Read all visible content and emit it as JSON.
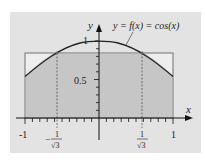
{
  "diagram": {
    "title_label": "y = f(x) = cos(x)",
    "function": "cos(x)",
    "axes": {
      "x_label": "x",
      "y_label": "y",
      "x_range": [
        -1,
        1
      ],
      "y_range": [
        0,
        1
      ]
    },
    "x_ticks": [
      {
        "value": -1,
        "label": "-1"
      },
      {
        "value": -0.57735,
        "label_num": "1",
        "label_den": "√3",
        "sign": "−"
      },
      {
        "value": 0.57735,
        "label_num": "1",
        "label_den": "√3",
        "sign": ""
      },
      {
        "value": 1,
        "label": "1"
      }
    ],
    "y_ticks": [
      {
        "value": 0.5,
        "label": "0.5"
      },
      {
        "value": 1,
        "label": "1"
      }
    ],
    "rectangle_height": 0.8384,
    "gauss_nodes": [
      -0.57735,
      0.57735
    ],
    "colors": {
      "panel_bg": "#e3e3e3",
      "rect_fill": "#c6c6c6",
      "rect_light": "#eeeeee",
      "curve": "#222222",
      "axis": "#111111"
    }
  }
}
